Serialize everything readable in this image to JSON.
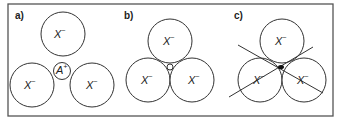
{
  "figure": {
    "colors": {
      "stroke": "#333333",
      "frame": "#555555",
      "cation_dot_c": "#111111"
    }
  },
  "panels": [
    {
      "label": "a)",
      "anion_label": "X",
      "anion_charge": "−",
      "cation_label": "A",
      "cation_charge": "+",
      "caption": "Cation larger than the interstitial site; anions do not touch"
    },
    {
      "label": "b)",
      "anion_label": "X",
      "anion_charge": "−",
      "caption": "Cation fits exactly; anions touching"
    },
    {
      "label": "c)",
      "anion_label": "X",
      "anion_charge": "−",
      "caption": "Cation too small; rattles in site"
    }
  ]
}
